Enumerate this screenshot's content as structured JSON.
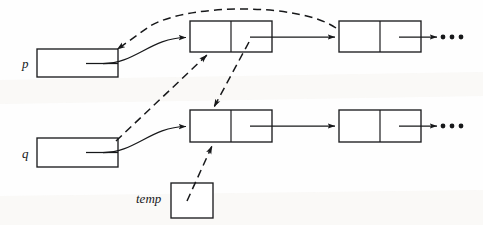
{
  "figure": {
    "background_color": "#fefefe",
    "ink_color": "#17181a"
  },
  "variables": [
    {
      "id": "p",
      "label": "p",
      "box_label": "",
      "x": 37,
      "y": 49,
      "w": 81,
      "h": 28
    },
    {
      "id": "q",
      "label": "q",
      "box_label": "",
      "x": 37,
      "y": 138,
      "w": 81,
      "h": 29
    },
    {
      "id": "temp",
      "label": "temp",
      "box_label": "",
      "x": 171,
      "y": 183,
      "w": 42,
      "h": 35
    }
  ],
  "nodes": [
    {
      "id": "top-node-1",
      "row": "top",
      "index": 1,
      "data_label": "",
      "next_label": "",
      "x": 190,
      "y": 21,
      "w": 82,
      "h": 31,
      "split": 41
    },
    {
      "id": "top-node-2",
      "row": "top",
      "index": 2,
      "data_label": "",
      "next_label": "",
      "x": 339,
      "y": 21,
      "w": 82,
      "h": 31,
      "split": 41
    },
    {
      "id": "bottom-node-1",
      "row": "bottom",
      "index": 1,
      "data_label": "",
      "next_label": "",
      "x": 190,
      "y": 110,
      "w": 82,
      "h": 32,
      "split": 41
    },
    {
      "id": "bottom-node-2",
      "row": "bottom",
      "index": 2,
      "data_label": "",
      "next_label": "",
      "x": 339,
      "y": 110,
      "w": 82,
      "h": 32,
      "split": 41
    }
  ],
  "ellipses": [
    {
      "id": "top-ellipsis",
      "text": "• • •",
      "x": 442,
      "y": 37
    },
    {
      "id": "bottom-ellipsis",
      "text": "• • •",
      "x": 442,
      "y": 126
    }
  ],
  "links": {
    "solid": [
      {
        "id": "p-to-top-node-1",
        "style": "solid",
        "from": "p",
        "to": "top-node-1"
      },
      {
        "id": "q-to-bottom-node-1",
        "style": "solid",
        "from": "q",
        "to": "bottom-node-1"
      },
      {
        "id": "top-node-1-to-top-node-2",
        "style": "solid",
        "from": "top-node-1",
        "to": "top-node-2"
      },
      {
        "id": "bottom-node-1-to-bottom-node-2",
        "style": "solid",
        "from": "bottom-node-1",
        "to": "bottom-node-2"
      },
      {
        "id": "top-node-2-to-ellipsis",
        "style": "solid",
        "from": "top-node-2",
        "to": "top-ellipsis"
      },
      {
        "id": "bottom-node-2-to-ellipsis",
        "style": "solid",
        "from": "bottom-node-2",
        "to": "bottom-ellipsis"
      }
    ],
    "dashed": [
      {
        "id": "dashed-p-reassign",
        "style": "dashed",
        "from": "top-node-2",
        "to": "p",
        "note": "long arc over the top of the figure"
      },
      {
        "id": "dashed-q-to-top-node-1",
        "style": "dashed",
        "from": "q",
        "to": "top-node-1"
      },
      {
        "id": "dashed-top-node-1-next-to-bottom-node-1",
        "style": "dashed",
        "from": "top-node-1",
        "to": "bottom-node-1"
      },
      {
        "id": "dashed-temp-to-bottom-node-1",
        "style": "dashed",
        "from": "temp",
        "to": "bottom-node-1"
      }
    ]
  }
}
